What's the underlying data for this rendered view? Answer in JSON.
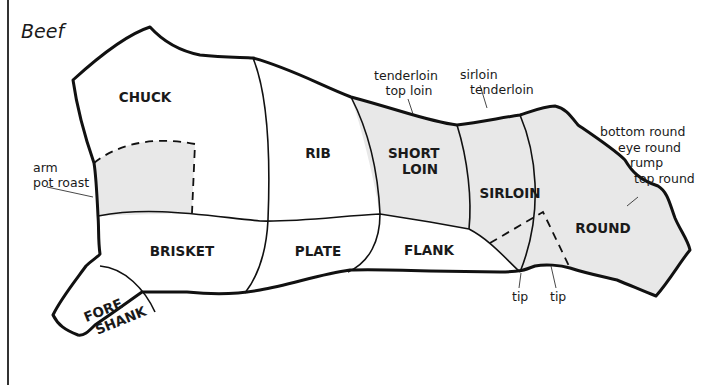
{
  "title": "Beef",
  "colors": {
    "outline": "#111111",
    "shaded_fill": "#e8e8e8",
    "unshaded_fill": "#ffffff",
    "text": "#1a1a1a"
  },
  "cuts": [
    {
      "id": "chuck",
      "label_lines": [
        "CHUCK"
      ],
      "shaded": false
    },
    {
      "id": "rib",
      "label_lines": [
        "RIB"
      ],
      "shaded": false
    },
    {
      "id": "short-loin",
      "label_lines": [
        "SHORT",
        "LOIN"
      ],
      "shaded": true
    },
    {
      "id": "sirloin",
      "label_lines": [
        "SIRLOIN"
      ],
      "shaded": true
    },
    {
      "id": "round",
      "label_lines": [
        "ROUND"
      ],
      "shaded": true
    },
    {
      "id": "brisket",
      "label_lines": [
        "BRISKET"
      ],
      "shaded": false
    },
    {
      "id": "plate",
      "label_lines": [
        "PLATE"
      ],
      "shaded": false
    },
    {
      "id": "flank",
      "label_lines": [
        "FLANK"
      ],
      "shaded": false
    },
    {
      "id": "fore-shank",
      "label_lines": [
        "FORE",
        "SHANK"
      ],
      "shaded": false
    },
    {
      "id": "arm-pot-roast",
      "label_lines": [],
      "shaded": true
    }
  ],
  "callouts": [
    {
      "id": "arm-pot-roast",
      "lines": [
        "arm",
        "pot roast"
      ]
    },
    {
      "id": "short-loin-subcuts",
      "lines": [
        "tenderloin",
        "top loin"
      ]
    },
    {
      "id": "sirloin-subcuts",
      "lines": [
        "sirloin",
        "tenderloin"
      ]
    },
    {
      "id": "round-subcuts",
      "lines": [
        "bottom round",
        "eye round",
        "rump",
        "top round"
      ]
    },
    {
      "id": "tip-1",
      "lines": [
        "tip"
      ]
    },
    {
      "id": "tip-2",
      "lines": [
        "tip"
      ]
    }
  ]
}
